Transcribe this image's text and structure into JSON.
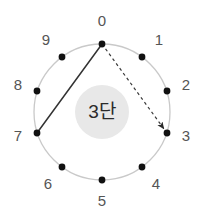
{
  "diagram": {
    "center_label": "3단",
    "background_color": "#ffffff",
    "circle": {
      "cx": 102,
      "cy": 112,
      "r": 68,
      "stroke_color": "#c9c9c9",
      "stroke_width": 1.3
    },
    "inner_disc": {
      "cx": 102,
      "cy": 112,
      "r": 27,
      "fill_color": "#e8e8e8"
    },
    "node_style": {
      "dot_color": "#111111",
      "dot_radius": 3.4,
      "label_color": "#555555",
      "label_font_size": 15
    },
    "nodes": [
      {
        "id": "node-0",
        "label": "0",
        "angle_deg": 0,
        "cx": 102,
        "cy": 44,
        "label_x": 102,
        "label_y": 22
      },
      {
        "id": "node-1",
        "label": "1",
        "angle_deg": 36,
        "cx": 142,
        "cy": 57,
        "label_x": 159,
        "label_y": 41
      },
      {
        "id": "node-2",
        "label": "2",
        "angle_deg": 72,
        "cx": 167,
        "cy": 91,
        "label_x": 186,
        "label_y": 86
      },
      {
        "id": "node-3",
        "label": "3",
        "angle_deg": 108,
        "cx": 167,
        "cy": 133,
        "label_x": 186,
        "label_y": 137
      },
      {
        "id": "node-4",
        "label": "4",
        "angle_deg": 144,
        "cx": 142,
        "cy": 167,
        "label_x": 156,
        "label_y": 185
      },
      {
        "id": "node-5",
        "label": "5",
        "angle_deg": 180,
        "cx": 102,
        "cy": 180,
        "label_x": 102,
        "label_y": 202
      },
      {
        "id": "node-6",
        "label": "6",
        "angle_deg": 216,
        "cx": 62,
        "cy": 167,
        "label_x": 48,
        "label_y": 185
      },
      {
        "id": "node-7",
        "label": "7",
        "angle_deg": 252,
        "cx": 37,
        "cy": 133,
        "label_x": 18,
        "label_y": 137
      },
      {
        "id": "node-8",
        "label": "8",
        "angle_deg": 288,
        "cx": 37,
        "cy": 91,
        "label_x": 18,
        "label_y": 86
      },
      {
        "id": "node-9",
        "label": "9",
        "angle_deg": 324,
        "cx": 62,
        "cy": 57,
        "label_x": 46,
        "label_y": 41
      }
    ],
    "edges": [
      {
        "id": "edge-solid-0-7",
        "style": "solid",
        "from": "0",
        "to": "7",
        "x1": 102,
        "y1": 44,
        "x2": 37,
        "y2": 133,
        "color": "#333333",
        "width": 1.5,
        "arrow": false
      },
      {
        "id": "edge-dashed-0-3",
        "style": "dashed",
        "from": "0",
        "to": "3",
        "x1": 102,
        "y1": 44,
        "x2": 167,
        "y2": 133,
        "color": "#3a3a3a",
        "width": 1.2,
        "dash_pattern": "3 3",
        "arrow": true
      }
    ]
  }
}
